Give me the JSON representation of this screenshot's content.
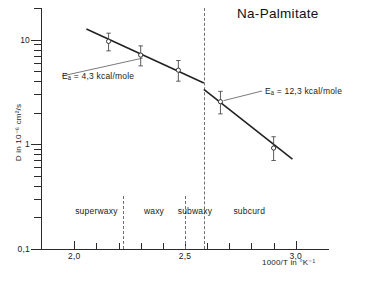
{
  "chart_data": {
    "type": "scatter",
    "title": "Na-Palmitate",
    "xlabel": "1000/T in °K⁻¹",
    "ylabel": "D in 10⁻⁶ cm²/s",
    "xlim": [
      1.85,
      3.15
    ],
    "ylim_log": [
      0.1,
      20
    ],
    "x_scale": "linear",
    "y_scale": "log",
    "grid": false,
    "legend": "none",
    "x_ticks_major": [
      {
        "value": 2.0,
        "label": "2,0"
      },
      {
        "value": 2.5,
        "label": "2,5"
      },
      {
        "value": 3.0,
        "label": "3,0"
      }
    ],
    "x_ticks_minor": [
      2.1,
      2.2,
      2.3,
      2.4,
      2.6,
      2.7,
      2.8,
      2.9
    ],
    "y_ticks_major": [
      {
        "value": 10,
        "label": "10"
      },
      {
        "value": 1,
        "label": "1"
      },
      {
        "value": 0.1,
        "label": "0,1"
      }
    ],
    "y_ticks_minor": [
      20,
      9,
      8,
      7,
      6,
      5,
      4,
      3,
      2,
      0.9,
      0.8,
      0.7,
      0.6,
      0.5,
      0.4,
      0.3,
      0.2
    ],
    "series": [
      {
        "name": "D measurements",
        "marker": "open-circle",
        "points": [
          {
            "x": 2.155,
            "y": 9.6,
            "yerr_up": 1.9,
            "yerr_down": 1.8
          },
          {
            "x": 2.3,
            "y": 7.1,
            "yerr_up": 1.6,
            "yerr_down": 1.5
          },
          {
            "x": 2.47,
            "y": 5.1,
            "yerr_up": 1.2,
            "yerr_down": 1.1
          },
          {
            "x": 2.66,
            "y": 2.55,
            "yerr_up": 0.65,
            "yerr_down": 0.6
          },
          {
            "x": 2.9,
            "y": 0.92,
            "yerr_up": 0.26,
            "yerr_down": 0.22
          }
        ]
      }
    ],
    "fit_lines": [
      {
        "name": "low-Ea fit",
        "x1": 2.055,
        "y1": 12.6,
        "x2": 2.585,
        "y2": 3.85,
        "activation_energy": "4,3 kcal/mole"
      },
      {
        "name": "high-Ea fit",
        "x1": 2.585,
        "y1": 3.35,
        "x2": 2.985,
        "y2": 0.72,
        "activation_energy": "12,3 kcal/mole"
      }
    ],
    "annotations": [
      {
        "name": "ea-low",
        "text": "Eₐ = 4,3 kcal/mole",
        "leader_from_x": 2.3,
        "leader_from_y": 7.1
      },
      {
        "name": "ea-high",
        "text": "Eₐ = 12,3 kcal/mole",
        "leader_from_x": 2.66,
        "leader_from_y": 2.55
      }
    ],
    "phase_dividers": [
      {
        "value": 2.22,
        "top_px": 196,
        "bottom_px": 249
      },
      {
        "value": 2.5,
        "top_px": 196,
        "bottom_px": 249
      },
      {
        "value": 2.585,
        "top_px": 8,
        "bottom_px": 249
      }
    ],
    "phase_regions": [
      {
        "label": "superwaxy",
        "center_x": 2.1
      },
      {
        "label": "waxy",
        "center_x": 2.36
      },
      {
        "label": "subwaxy",
        "center_x": 2.545
      },
      {
        "label": "subcurd",
        "center_x": 2.79
      }
    ]
  },
  "colors": {
    "ink": "#1a1a1a",
    "axis": "#2b2b2b",
    "fit_line": "#222222",
    "divider": "#6f6f6f",
    "marker_edge": "#333333",
    "background": "#ffffff"
  }
}
